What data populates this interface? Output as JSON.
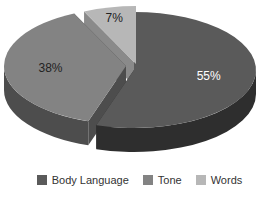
{
  "chart_data": {
    "type": "pie",
    "style": "3d-exploded",
    "categories": [
      "Body Language",
      "Tone",
      "Words"
    ],
    "values": [
      55,
      38,
      7
    ],
    "labels": [
      "55%",
      "38%",
      "7%"
    ],
    "colors": [
      "#5a5a5a",
      "#838383",
      "#b7b7b7"
    ],
    "side_colors": [
      "#2e2e2e",
      "#4d4d4d",
      "#8a8a8a"
    ],
    "title": "",
    "legend_position": "bottom"
  },
  "legend": [
    {
      "label": "Body Language",
      "color": "#5a5a5a"
    },
    {
      "label": "Tone",
      "color": "#838383"
    },
    {
      "label": "Words",
      "color": "#b7b7b7"
    }
  ]
}
